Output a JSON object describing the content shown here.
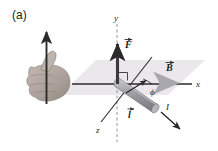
{
  "figure": {
    "panel_label": "(a)",
    "colors": {
      "plane_fill": "#e9e7ea",
      "axis_stroke": "#2b2b2b",
      "rod_fill": "#9b9aa0",
      "rod_highlight": "#c4c3c8",
      "force_arrow": "#3a3a3a",
      "b_arrow": "#b9b8bd",
      "hand_fill": "#b3aaa4",
      "text": "#1c1c1c"
    },
    "axes": [
      {
        "name": "y-axis",
        "label": "y",
        "direction": "up"
      },
      {
        "name": "x-axis",
        "label": "x",
        "direction": "right"
      },
      {
        "name": "z-axis",
        "label": "z",
        "direction": "down-left"
      }
    ],
    "vectors": [
      {
        "name": "force-vector",
        "label": "F",
        "accent": "arrow",
        "bold": true
      },
      {
        "name": "magnetic-field-vector",
        "label": "B",
        "accent": "arrow",
        "bold": true
      },
      {
        "name": "length-vector",
        "label": "l",
        "accent": "arrow",
        "bold": true
      }
    ],
    "annotations": {
      "angle_label": "ϕ",
      "current_label": "I",
      "right_angle_marker": "right-angle"
    },
    "hand": {
      "name": "right-hand-rule-hand",
      "thumb_arrow": "up"
    }
  }
}
